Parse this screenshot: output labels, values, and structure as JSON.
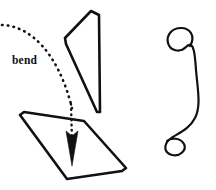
{
  "figure": {
    "title": "bend",
    "background_color": "#ffffff",
    "stroke_color": "#111111",
    "width": 216,
    "height": 190
  },
  "annotation": {
    "bend_label": "bend",
    "label_x": 12,
    "label_y": 64,
    "arc_color": "#151515",
    "arrow_color": "#111111"
  },
  "shapes": {
    "upper_panel_name": "upper-panel",
    "lower_panel_name": "lower-panel",
    "ribbon_name": "coiled-ribbon"
  },
  "geometry": {
    "upper_panel_path": "M 65 38 L 91 11 L 99 15 L 100 112 L 97 112 L 66 44 Z",
    "lower_panel_path": "M 20 115 L 24 112 L 84 121 L 126 168 L 122 171 L 67 179 Z",
    "ribbon_path": "M 190 46 C 196 36 190 28 181 28 C 172 28 166 35 168 43 C 170 51 180 53 186 47 C 194 39 195 55 196 70 C 198 92 201 106 195 118 C 189 130 176 134 170 139 C 163 145 164 153 172 155 C 180 157 187 150 184 144 C 181 138 171 137 167 141",
    "bend_arc_path": "M 2 25 C 30 26 58 52 72 108",
    "arrow_shaft_path": "M 71 104 L 72 140",
    "arrow_head_path": "M 72 166 L 66 131 L 72 136 L 78 131 Z"
  }
}
